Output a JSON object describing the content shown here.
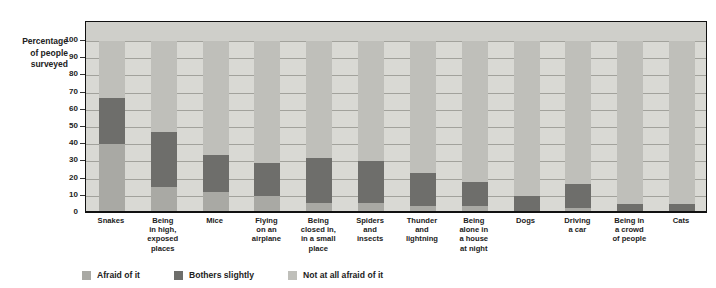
{
  "top_title": "",
  "axis_title": "Percentage\nof people\nsurveyed",
  "axis_title_lines": [
    "Percentage",
    "of people",
    "surveyed"
  ],
  "legend": {
    "items": [
      {
        "label": "Afraid of it",
        "color": "#a9a9a4",
        "key": "afraid"
      },
      {
        "label": "Bothers slightly",
        "color": "#6e6e6b",
        "key": "bothers"
      },
      {
        "label": "Not at all afraid of it",
        "color": "#bfbfba",
        "key": "not_afraid"
      }
    ]
  },
  "chart_data": {
    "type": "bar",
    "subtype": "stacked-vertical",
    "title": "",
    "xlabel": "",
    "ylabel": "Percentage of people surveyed",
    "ylim": [
      0,
      100
    ],
    "yticks": [
      0,
      10,
      20,
      30,
      40,
      50,
      60,
      70,
      80,
      90,
      100
    ],
    "ytick_labels": [
      "0",
      "10",
      "20",
      "30",
      "40",
      "50",
      "60",
      "70",
      "80",
      "90",
      "100"
    ],
    "grid": true,
    "legend_position": "bottom-left",
    "categories": [
      "Snakes",
      "Being in high, exposed places",
      "Mice",
      "Flying on an airplane",
      "Being closed in, in a small place",
      "Spiders and insects",
      "Thunder and lightning",
      "Being alone in a house at night",
      "Dogs",
      "Driving a car",
      "Being in a crowd of people",
      "Cats"
    ],
    "category_label_lines": [
      [
        "Snakes"
      ],
      [
        "Being",
        "in high,",
        "exposed",
        "places"
      ],
      [
        "Mice"
      ],
      [
        "Flying",
        "on an",
        "airplane"
      ],
      [
        "Being",
        "closed in,",
        "in a small",
        "place"
      ],
      [
        "Spiders",
        "and",
        "insects"
      ],
      [
        "Thunder",
        "and",
        "lightning"
      ],
      [
        "Being",
        "alone in",
        "a house",
        "at night"
      ],
      [
        "Dogs"
      ],
      [
        "Driving",
        "a car"
      ],
      [
        "Being in",
        "a crowd",
        "of people"
      ],
      [
        "Cats"
      ]
    ],
    "series": [
      {
        "name": "Afraid of it",
        "color": "#a9a9a4",
        "values": [
          40,
          15,
          12,
          10,
          6,
          6,
          4,
          4,
          1,
          3,
          1,
          1
        ]
      },
      {
        "name": "Bothers slightly",
        "color": "#6e6e6b",
        "values": [
          27,
          32,
          22,
          19,
          26,
          24,
          19,
          14,
          9,
          14,
          4,
          4
        ]
      },
      {
        "name": "Not at all afraid of it",
        "color": "#bfbfba",
        "values": [
          33,
          53,
          66,
          71,
          68,
          70,
          77,
          82,
          90,
          83,
          95,
          95
        ]
      }
    ]
  }
}
